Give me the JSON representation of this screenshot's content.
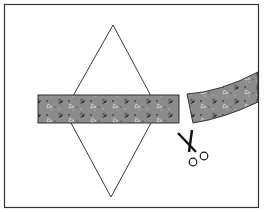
{
  "figure": {
    "colors": {
      "background": "#ffffff",
      "outline": "#222222",
      "strip_fill": "#8c8c8c",
      "speckle": "#1a1a1a"
    },
    "elements": [
      "frame",
      "rhombus",
      "strip-left-piece",
      "strip-right-piece",
      "scissors-icon"
    ]
  }
}
